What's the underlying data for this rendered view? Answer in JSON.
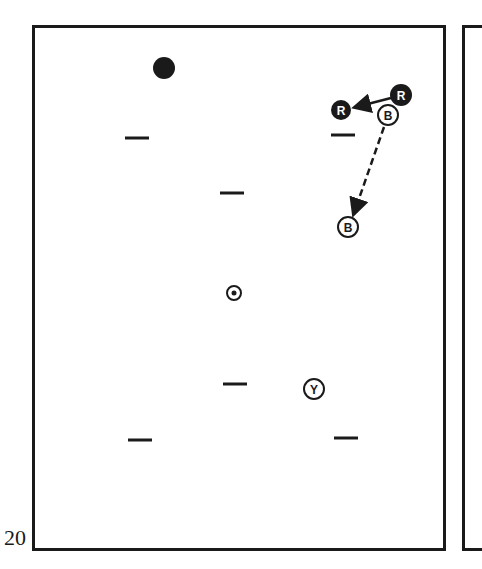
{
  "figure": {
    "number": "20"
  },
  "colors": {
    "ink": "#1a1a1a",
    "paper": "#ffffff"
  },
  "spots": [
    {
      "name": "spot-top-left",
      "x": 137,
      "y": 138
    },
    {
      "name": "spot-top-right",
      "x": 343,
      "y": 135
    },
    {
      "name": "spot-upper-center",
      "x": 232,
      "y": 193
    },
    {
      "name": "spot-lower-center",
      "x": 235,
      "y": 384
    },
    {
      "name": "spot-bottom-left",
      "x": 140,
      "y": 440
    },
    {
      "name": "spot-bottom-right",
      "x": 346,
      "y": 438
    }
  ],
  "balls": [
    {
      "name": "black-ball",
      "type": "solid",
      "label": "",
      "x": 164,
      "y": 68,
      "r": 11
    },
    {
      "name": "red-ball-start",
      "type": "solid",
      "label": "R",
      "x": 401,
      "y": 95,
      "r": 11
    },
    {
      "name": "red-ball-end",
      "type": "solid",
      "label": "R",
      "x": 341,
      "y": 110,
      "r": 10
    },
    {
      "name": "blue-ball-start",
      "type": "outline",
      "label": "B",
      "x": 388,
      "y": 115,
      "r": 10
    },
    {
      "name": "blue-ball-end",
      "type": "outline",
      "label": "B",
      "x": 348,
      "y": 227,
      "r": 10
    },
    {
      "name": "yellow-ball",
      "type": "outline",
      "label": "Y",
      "x": 314,
      "y": 389,
      "r": 10
    },
    {
      "name": "center-spot-marker",
      "type": "dot",
      "label": "",
      "x": 234,
      "y": 293,
      "r": 7
    }
  ],
  "paths": [
    {
      "name": "red-ball-path",
      "style": "solid",
      "x1": 391,
      "y1": 98,
      "x2": 356,
      "y2": 107
    },
    {
      "name": "blue-ball-path",
      "style": "dashed",
      "x1": 384,
      "y1": 127,
      "x2": 354,
      "y2": 213
    }
  ]
}
